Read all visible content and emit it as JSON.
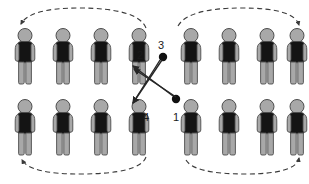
{
  "diagram": {
    "canvas": {
      "width": 309,
      "height": 184,
      "background": "#ffffff"
    },
    "figure_style": {
      "head_color": "#a8a8a8",
      "torso_color": "#141414",
      "arm_color": "#a8a8a8",
      "leg_color": "#a8a8a8",
      "outline_color": "#4d4d4d"
    },
    "path_style": {
      "dashed_arc_color": "#3a3a3a",
      "straight_arrow_color": "#262626",
      "dot_color": "#111111"
    },
    "groups": [
      {
        "name": "top-left-row",
        "count": 4,
        "x_positions": [
          14,
          52,
          90,
          128
        ],
        "y": 28
      },
      {
        "name": "top-right-row",
        "count": 4,
        "x_positions": [
          180,
          218,
          256,
          294
        ],
        "y": 28
      },
      {
        "name": "bottom-left-row",
        "count": 4,
        "x_positions": [
          14,
          52,
          90,
          128
        ],
        "y": 99
      },
      {
        "name": "bottom-right-row",
        "count": 4,
        "x_positions": [
          180,
          218,
          256,
          294
        ],
        "y": 99
      }
    ],
    "arcs": [
      {
        "name": "top-left-arc",
        "direction": "right-to-left",
        "arrowhead": "left"
      },
      {
        "name": "top-right-arc",
        "direction": "left-to-right",
        "arrowhead": "right"
      },
      {
        "name": "bottom-left-arc",
        "direction": "right-to-left",
        "arrowhead": "left"
      },
      {
        "name": "bottom-right-arc",
        "direction": "left-to-right",
        "arrowhead": "right"
      }
    ],
    "cross_arrows": [
      {
        "name": "arrow-from-3-to-4",
        "from_label": "3",
        "to_label": "4",
        "origin_dot": true
      },
      {
        "name": "arrow-from-1-to-2",
        "from_label": "1",
        "to_label": "2",
        "origin_dot": true
      }
    ],
    "labels": [
      {
        "id": "label-2",
        "text": "2",
        "x": 137,
        "y": 50
      },
      {
        "id": "label-3",
        "text": "3",
        "x": 160,
        "y": 44
      },
      {
        "id": "label-4",
        "text": "4",
        "x": 143,
        "y": 112
      },
      {
        "id": "label-1",
        "text": "1",
        "x": 173,
        "y": 112
      }
    ]
  }
}
